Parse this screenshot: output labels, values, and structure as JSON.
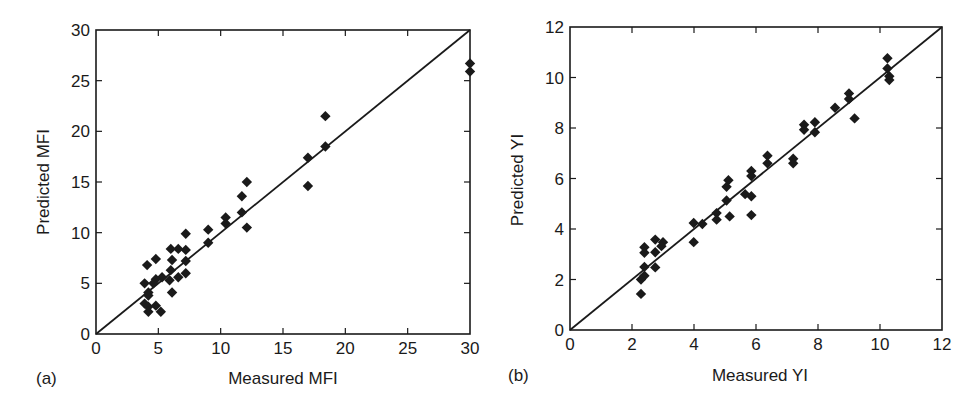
{
  "chart_data": [
    {
      "type": "scatter",
      "panel_label": "(a)",
      "title": "",
      "xlabel": "Measured MFI",
      "ylabel": "Predicted MFI",
      "xlim": [
        0,
        30
      ],
      "ylim": [
        0,
        30
      ],
      "xticks": [
        0,
        5,
        10,
        15,
        20,
        25,
        30
      ],
      "yticks": [
        0,
        5,
        10,
        15,
        20,
        25,
        30
      ],
      "grid": false,
      "reference_line": {
        "label": "y = x",
        "from": [
          0,
          0
        ],
        "to": [
          30,
          30
        ]
      },
      "marker": "diamond",
      "marker_color": "#1a1a1a",
      "series": [
        {
          "name": "MFI",
          "points": [
            [
              30.0,
              26.7
            ],
            [
              30.0,
              25.9
            ],
            [
              18.4,
              21.5
            ],
            [
              18.4,
              18.5
            ],
            [
              17.0,
              17.4
            ],
            [
              17.0,
              14.6
            ],
            [
              12.1,
              15.0
            ],
            [
              11.7,
              13.6
            ],
            [
              11.7,
              12.0
            ],
            [
              12.1,
              10.5
            ],
            [
              10.4,
              11.5
            ],
            [
              10.4,
              10.9
            ],
            [
              9.0,
              10.3
            ],
            [
              9.0,
              9.0
            ],
            [
              7.2,
              9.9
            ],
            [
              7.2,
              8.3
            ],
            [
              7.2,
              7.2
            ],
            [
              7.2,
              6.0
            ],
            [
              6.6,
              8.4
            ],
            [
              6.0,
              8.4
            ],
            [
              6.1,
              7.3
            ],
            [
              6.6,
              5.6
            ],
            [
              6.0,
              6.3
            ],
            [
              5.9,
              5.3
            ],
            [
              6.1,
              4.1
            ],
            [
              5.3,
              5.6
            ],
            [
              4.8,
              7.4
            ],
            [
              4.1,
              6.8
            ],
            [
              4.8,
              5.4
            ],
            [
              4.6,
              5.0
            ],
            [
              3.9,
              5.0
            ],
            [
              4.2,
              4.1
            ],
            [
              4.2,
              3.8
            ],
            [
              3.9,
              3.0
            ],
            [
              4.2,
              2.7
            ],
            [
              4.8,
              2.8
            ],
            [
              4.2,
              2.2
            ],
            [
              5.2,
              2.2
            ]
          ]
        }
      ]
    },
    {
      "type": "scatter",
      "panel_label": "(b)",
      "title": "",
      "xlabel": "Measured YI",
      "ylabel": "Predicted YI",
      "xlim": [
        0,
        12
      ],
      "ylim": [
        0,
        12
      ],
      "xticks": [
        0,
        2,
        4,
        6,
        8,
        10,
        12
      ],
      "yticks": [
        0,
        2,
        4,
        6,
        8,
        10,
        12
      ],
      "grid": false,
      "reference_line": {
        "label": "y = x",
        "from": [
          0,
          0
        ],
        "to": [
          12,
          12
        ]
      },
      "marker": "diamond",
      "marker_color": "#1a1a1a",
      "series": [
        {
          "name": "YI",
          "points": [
            [
              10.24,
              10.76
            ],
            [
              10.24,
              10.36
            ],
            [
              10.3,
              10.05
            ],
            [
              10.3,
              9.9
            ],
            [
              9.0,
              9.37
            ],
            [
              9.0,
              9.15
            ],
            [
              9.18,
              8.38
            ],
            [
              8.55,
              8.8
            ],
            [
              7.9,
              8.23
            ],
            [
              7.9,
              7.83
            ],
            [
              7.55,
              8.13
            ],
            [
              7.55,
              7.93
            ],
            [
              7.2,
              6.78
            ],
            [
              7.2,
              6.6
            ],
            [
              6.37,
              6.9
            ],
            [
              6.37,
              6.6
            ],
            [
              5.85,
              6.3
            ],
            [
              5.85,
              6.1
            ],
            [
              5.85,
              5.3
            ],
            [
              5.65,
              5.38
            ],
            [
              5.85,
              4.55
            ],
            [
              5.11,
              5.93
            ],
            [
              5.05,
              5.67
            ],
            [
              5.05,
              5.13
            ],
            [
              5.15,
              4.5
            ],
            [
              4.73,
              4.63
            ],
            [
              4.73,
              4.37
            ],
            [
              4.27,
              4.2
            ],
            [
              3.99,
              4.24
            ],
            [
              3.99,
              3.48
            ],
            [
              3.0,
              3.48
            ],
            [
              2.95,
              3.32
            ],
            [
              2.75,
              3.58
            ],
            [
              2.75,
              3.08
            ],
            [
              2.75,
              2.48
            ],
            [
              2.4,
              3.28
            ],
            [
              2.4,
              3.06
            ],
            [
              2.4,
              2.5
            ],
            [
              2.4,
              2.15
            ],
            [
              2.29,
              2.0
            ],
            [
              2.29,
              1.43
            ]
          ]
        }
      ]
    }
  ]
}
